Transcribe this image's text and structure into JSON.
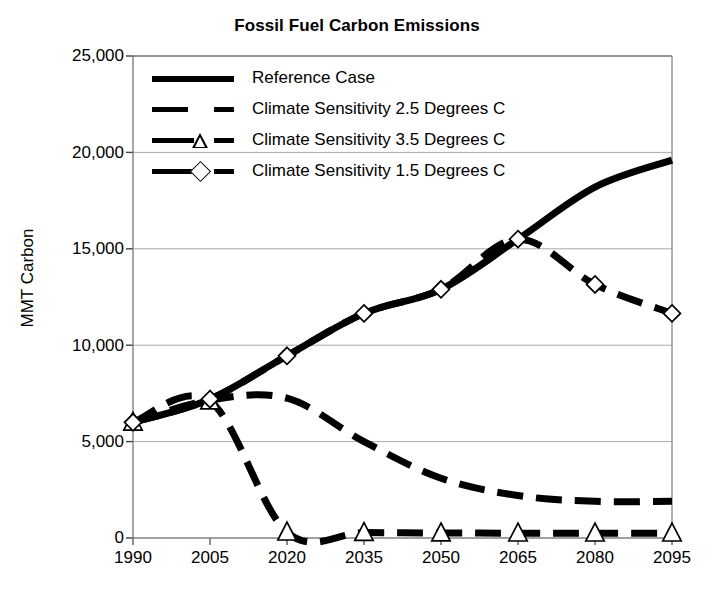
{
  "chart_data": {
    "type": "line",
    "title": "Fossil Fuel Carbon Emissions",
    "xlabel": "",
    "ylabel": "MMT Carbon",
    "categories": [
      "1990",
      "2005",
      "2020",
      "2035",
      "2050",
      "2065",
      "2080",
      "2095"
    ],
    "x": [
      1990,
      2005,
      2020,
      2035,
      2050,
      2065,
      2080,
      2095
    ],
    "xlim": [
      1990,
      2095
    ],
    "ylim": [
      0,
      25000
    ],
    "yticks": [
      "0",
      "5,000",
      "10,000",
      "15,000",
      "20,000",
      "25,000"
    ],
    "ytick_values": [
      0,
      5000,
      10000,
      15000,
      20000,
      25000
    ],
    "grid": true,
    "legend_position": "upper-left-inside",
    "series": [
      {
        "name": "Reference Case",
        "style": "solid",
        "marker": "none",
        "color": "#000000",
        "values": [
          6000,
          7200,
          9450,
          11650,
          12900,
          15500,
          18200,
          19600
        ]
      },
      {
        "name": "Climate Sensitivity 2.5 Degrees C",
        "style": "dashed",
        "marker": "none",
        "color": "#000000",
        "values": [
          6000,
          7150,
          7250,
          5000,
          3100,
          2200,
          1900,
          1900
        ]
      },
      {
        "name": "Climate Sensitivity 3.5 Degrees C",
        "style": "dashed",
        "marker": "triangle",
        "color": "#000000",
        "values": [
          6000,
          7100,
          300,
          280,
          260,
          250,
          250,
          250
        ]
      },
      {
        "name": "Climate Sensitivity 1.5 Degrees C",
        "style": "dashed",
        "marker": "diamond",
        "color": "#000000",
        "values": [
          6000,
          7200,
          9450,
          11650,
          12900,
          15500,
          13150,
          11650
        ]
      }
    ]
  },
  "axis": {
    "gridline_color": "#a8a8a8",
    "axis_color": "#808080",
    "frame_color": "#555555"
  }
}
